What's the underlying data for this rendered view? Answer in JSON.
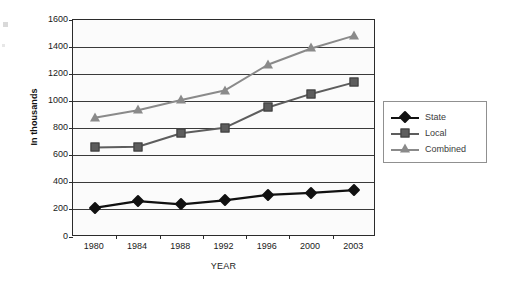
{
  "chart_data": {
    "type": "line",
    "title": "",
    "xlabel": "YEAR",
    "ylabel": "In thousands",
    "categories": [
      "1980",
      "1984",
      "1988",
      "1992",
      "1996",
      "2000",
      "2003"
    ],
    "ylim": [
      0,
      1600
    ],
    "yticks": [
      0,
      200,
      400,
      600,
      800,
      1000,
      1200,
      1400,
      1600
    ],
    "ytick_labels": [
      "0",
      "200",
      "400",
      "600",
      "800",
      "1000",
      "1200",
      "1400",
      "1600"
    ],
    "grid": true,
    "legend_position": "right",
    "series": [
      {
        "name": "State",
        "marker": "diamond",
        "color": "#111111",
        "values": [
          215,
          265,
          240,
          270,
          310,
          325,
          345
        ]
      },
      {
        "name": "Local",
        "marker": "square",
        "color": "#5d5d5d",
        "values": [
          660,
          665,
          765,
          805,
          955,
          1055,
          1140
        ]
      },
      {
        "name": "Combined",
        "marker": "triangle",
        "color": "#8a8a8a",
        "values": [
          880,
          935,
          1010,
          1080,
          1270,
          1390,
          1485
        ]
      }
    ]
  },
  "legend": {
    "items": [
      {
        "label": "State"
      },
      {
        "label": "Local"
      },
      {
        "label": "Combined"
      }
    ]
  },
  "axes": {
    "y_title": "In thousands",
    "x_title": "YEAR"
  }
}
